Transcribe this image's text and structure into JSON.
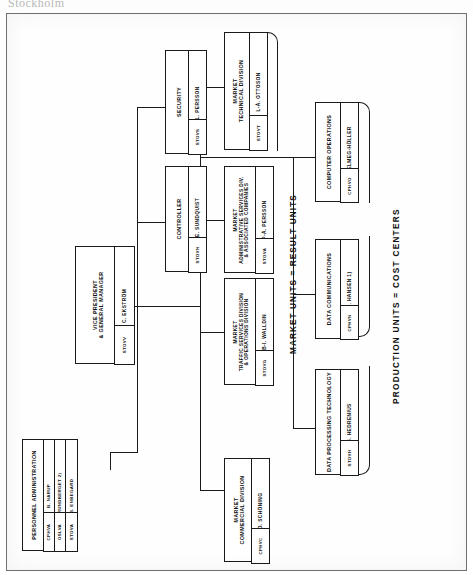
{
  "page": {
    "artifact_text": "Stockholm",
    "captions": [
      {
        "id": "result-units",
        "text": "MARKET UNITS = RESULT UNITS"
      },
      {
        "id": "cost-centers",
        "text": "PRODUCTION UNITS = COST CENTERS"
      }
    ]
  },
  "chart_title": "Organization Chart",
  "nodes": {
    "vice_president": {
      "title": "VICE PRESIDENT\n& GENERAL MANAGER",
      "title_line1": "VICE PRESIDENT",
      "title_line2": "& GENERAL MANAGER",
      "code": "STOVV",
      "person": "C. EKSTRÖM"
    },
    "security": {
      "title_line1": "SECURITY",
      "title_line2": "",
      "code": "STOVS",
      "person": "L. PERSSON"
    },
    "controller": {
      "title_line1": "CONTROLLER",
      "title_line2": "",
      "code": "STOVN",
      "person": "J-E. SUNDQUIST"
    },
    "personnel_administration": {
      "title_line1": "PERSONNEL ADMINISTRATION",
      "title_line2": "",
      "codes": [
        {
          "code": "CPHVA",
          "person": "B. NÄRUP"
        },
        {
          "code": "OSLVA",
          "person": "J. RUNDBERGET 2)"
        },
        {
          "code": "STOVA",
          "person": "B. ENBEGARD"
        }
      ]
    },
    "market_technical_division": {
      "title_line1": "MARKET",
      "title_line2": "TECHNICAL DIVISION",
      "code": "STOVT",
      "person": "L-Å. OTTOSON"
    },
    "market_administrative_services": {
      "title_line1": "MARKET",
      "title_line2": "ADMINISTRATIVE SERVICES DIV.",
      "title_line3": "& ASSOCIATED COMPANIES",
      "code": "STOVA",
      "person": "P-Å. PERSSON"
    },
    "market_traffic_services": {
      "title_line1": "MARKET",
      "title_line2": "TRAFFIC SERVICES DIVISION",
      "title_line3": "& OPERATIONS DIVISION",
      "code": "STOVG",
      "person": "B-I. WALLDIN"
    },
    "market_commercial_division": {
      "title_line1": "MARKET",
      "title_line2": "COMMERCIAL DIVISION",
      "code": "CPHVC",
      "person": "O. SCHÖNING"
    },
    "computer_operations": {
      "title_line1": "COMPUTER OPERATIONS",
      "title_line2": "",
      "code": "CPHVO",
      "person": "J. SELMEG-HÖLLER"
    },
    "data_communications": {
      "title_line1": "DATA COMMUNICATIONS",
      "title_line2": "",
      "code": "CPHVN",
      "person": "A. HANSEN  1)"
    },
    "data_processing_technology": {
      "title_line1": "DATA PROCESSING TECHNOLOGY",
      "title_line2": "",
      "code": "STOVH",
      "person": "B. HEDRENIUS"
    }
  },
  "colors": {
    "ink": "#1a1a1a",
    "paper": "#fefefe",
    "frame": "#6f6f6f"
  }
}
